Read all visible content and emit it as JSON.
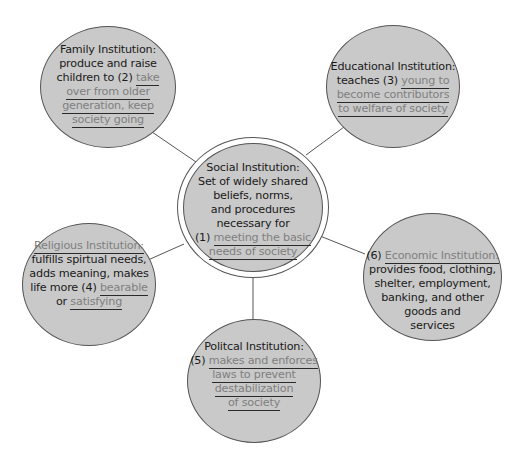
{
  "colors": {
    "node_fill": "#c9c9c9",
    "text": "#1a1a1a",
    "answer_text": "#7f7f7f",
    "connector": "#555555"
  },
  "center": {
    "title": "Social Institution:",
    "lines": [
      "Set of widely shared",
      "beliefs, norms,",
      "and procedures",
      "necessary for"
    ],
    "number": "(1)",
    "answer_lines": [
      "meeting the basic",
      "needs of society"
    ]
  },
  "family": {
    "title": "Family Institution:",
    "line1": "produce and raise",
    "line2_prefix": "children to (2)",
    "answer_lines": [
      "take",
      "over from older",
      "generation, keep",
      "society going"
    ]
  },
  "educational": {
    "title": "Educational Institution:",
    "line1_prefix": "teaches (3)",
    "answer_lines": [
      "young to",
      "become contributors",
      "to welfare of society"
    ]
  },
  "religious": {
    "title": "Religious Institution:",
    "lines": [
      "fulfills spirtual needs,",
      "adds meaning, makes"
    ],
    "line3_prefix": "life more (4)",
    "answer1": "bearable",
    "line4_prefix": "or",
    "answer2": "satisfying"
  },
  "economic": {
    "number": "(6)",
    "title": "Economic Institution:",
    "lines": [
      "provides food, clothing,",
      "shelter, employment,",
      "banking, and other",
      "goods and",
      "services"
    ]
  },
  "political": {
    "title": "Politcal Institution:",
    "number": "(5)",
    "answer_lines": [
      "makes and enforces",
      "laws to prevent",
      "destabilization",
      "of society"
    ]
  }
}
